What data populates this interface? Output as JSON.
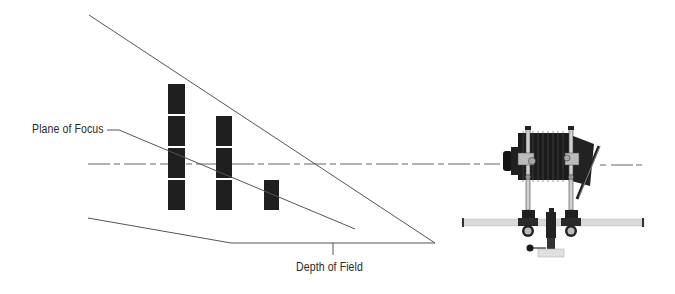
{
  "diagram": {
    "type": "depth-of-field-illustration",
    "labels": {
      "plane_of_focus": "Plane of Focus",
      "depth_of_field": "Depth of Field"
    },
    "colors": {
      "background": "#ffffff",
      "line": "#555555",
      "block": "#1f1f1f",
      "rail": "#d8d8d8",
      "camera": "#1a1a1a",
      "label": "#2a2a2a"
    },
    "subject_columns": [
      {
        "name": "near",
        "block_count": 4
      },
      {
        "name": "middle",
        "block_count": 3
      },
      {
        "name": "far",
        "block_count": 1
      }
    ],
    "camera": {
      "description": "view camera with bellows on rail and tripod head"
    }
  }
}
